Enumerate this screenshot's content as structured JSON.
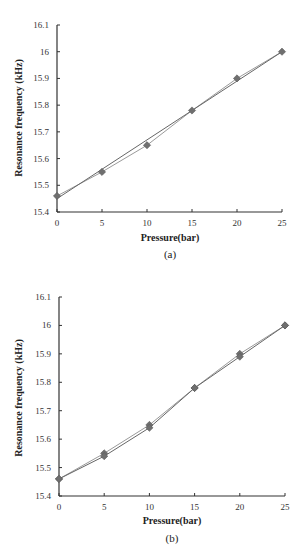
{
  "chart_data": [
    {
      "type": "line",
      "panel_label": "(a)",
      "title": "",
      "xlabel": "Pressure(bar)",
      "ylabel": "Resonance  frequency (kHz)",
      "xlim": [
        0,
        25
      ],
      "ylim": [
        15.4,
        16.1
      ],
      "xticks": [
        "0",
        "5",
        "10",
        "15",
        "20",
        "25"
      ],
      "yticks": [
        "15.4",
        "15.5",
        "15.6",
        "15.7",
        "15.8",
        "15.9",
        "16",
        "16.1"
      ],
      "grid": false,
      "legend": null,
      "x": [
        0,
        5,
        10,
        15,
        20,
        25
      ],
      "series": [
        {
          "name": "measured",
          "marker": "diamond",
          "color": "#777777",
          "values": [
            15.46,
            15.55,
            15.65,
            15.78,
            15.9,
            16.0
          ]
        },
        {
          "name": "linear fit",
          "marker": "none",
          "color": "#666666",
          "values": [
            15.45,
            15.56,
            15.67,
            15.78,
            15.89,
            16.0
          ]
        }
      ]
    },
    {
      "type": "line",
      "panel_label": "(b)",
      "title": "",
      "xlabel": "Pressure(bar)",
      "ylabel": "Resonance  frequency (kHz)",
      "xlim": [
        0,
        25
      ],
      "ylim": [
        15.4,
        16.1
      ],
      "xticks": [
        "0",
        "5",
        "10",
        "15",
        "20",
        "25"
      ],
      "yticks": [
        "15.4",
        "15.5",
        "15.6",
        "15.7",
        "15.8",
        "15.9",
        "16",
        "16.1"
      ],
      "grid": false,
      "legend": null,
      "x": [
        0,
        5,
        10,
        15,
        20,
        25
      ],
      "series": [
        {
          "name": "run 1",
          "marker": "diamond",
          "color": "#777777",
          "values": [
            15.46,
            15.55,
            15.65,
            15.78,
            15.9,
            16.0
          ]
        },
        {
          "name": "run 2",
          "marker": "diamond",
          "color": "#888888",
          "values": [
            15.46,
            15.54,
            15.64,
            15.78,
            15.89,
            16.0
          ]
        }
      ]
    }
  ],
  "panels": [
    {
      "label": "(a)",
      "xlabel": "Pressure(bar)",
      "ylabel": "Resonance  frequency (kHz)"
    },
    {
      "label": "(b)",
      "xlabel": "Pressure(bar)",
      "ylabel": "Resonance  frequency (kHz)"
    }
  ]
}
